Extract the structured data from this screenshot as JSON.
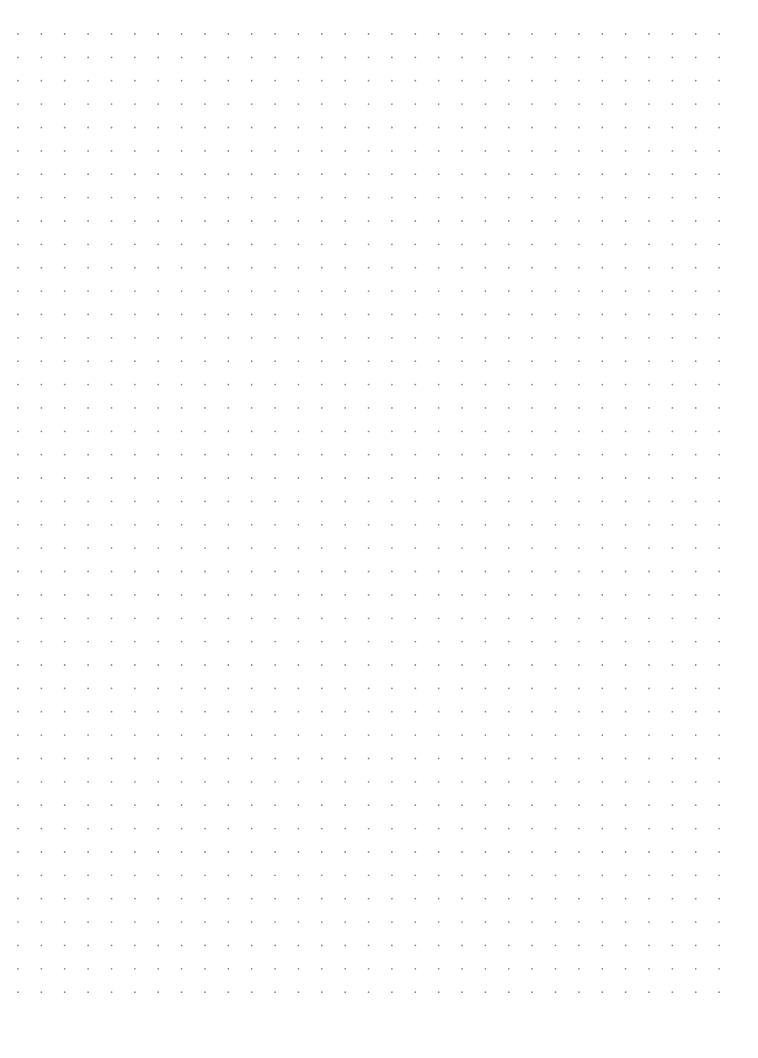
{
  "page": {
    "type": "dot-grid-paper",
    "background": "#ffffff",
    "dot_color": "#8a8a8a",
    "dot_radius": 0.9,
    "grid": {
      "columns": 31,
      "rows": 42,
      "origin_x": 18,
      "origin_y": 34,
      "spacing_x": 23.37,
      "spacing_y": 23.37
    }
  }
}
